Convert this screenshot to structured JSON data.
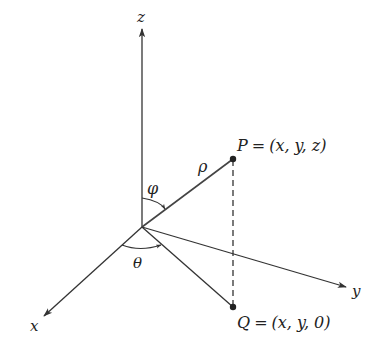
{
  "diagram": {
    "type": "spherical-coordinates",
    "axes": {
      "x": {
        "label": "x"
      },
      "y": {
        "label": "y"
      },
      "z": {
        "label": "z"
      }
    },
    "points": {
      "P": {
        "name": "P",
        "eq": "=",
        "coords": "(x, y, z)"
      },
      "Q": {
        "name": "Q",
        "eq": "=",
        "coords": "(x, y, 0)"
      }
    },
    "angles": {
      "phi": "φ",
      "theta": "θ"
    },
    "radius": "ρ",
    "colors": {
      "line": "#333333",
      "background": "#ffffff"
    }
  }
}
